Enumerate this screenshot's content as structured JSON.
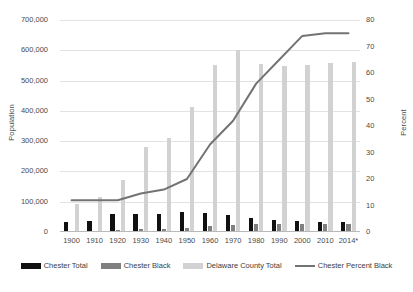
{
  "chart_data": {
    "type": "bar",
    "title": "",
    "subtitle": "",
    "xlabel": "",
    "ylabel": "Population",
    "ylabel_secondary": "Percent",
    "ylim": [
      0,
      700000
    ],
    "ylim_secondary": [
      0,
      80
    ],
    "grid": true,
    "legend_position": "bottom",
    "categories": [
      "1900",
      "1910",
      "1920",
      "1930",
      "1940",
      "1950",
      "1960",
      "1970",
      "1980",
      "1990",
      "2000",
      "2010",
      "2014*"
    ],
    "ytick_labels": [
      "0",
      "100,000",
      "200,000",
      "300,000",
      "400,000",
      "500,000",
      "600,000",
      "700,000"
    ],
    "ytick_values": [
      0,
      100000,
      200000,
      300000,
      400000,
      500000,
      600000,
      700000
    ],
    "ytick_labels_secondary": [
      "0",
      "10",
      "20",
      "30",
      "40",
      "50",
      "60",
      "70",
      "80"
    ],
    "ytick_values_secondary": [
      0,
      10,
      20,
      30,
      40,
      50,
      60,
      70,
      80
    ],
    "series": [
      {
        "name": "Chester Total",
        "kind": "bar",
        "axis": "left",
        "color": "#111111",
        "values": [
          34000,
          38000,
          58000,
          59000,
          59000,
          66000,
          63000,
          56000,
          45000,
          41000,
          36000,
          34000,
          34000
        ]
      },
      {
        "name": "Chester Black",
        "kind": "bar",
        "axis": "left",
        "color": "#808080",
        "values": [
          4000,
          4500,
          7000,
          8500,
          9000,
          13000,
          21000,
          23000,
          26000,
          26000,
          27000,
          25000,
          25000
        ]
      },
      {
        "name": "Delaware County Total",
        "kind": "bar",
        "axis": "left",
        "color": "#d2d2d2",
        "values": [
          94000,
          117000,
          173000,
          280000,
          310000,
          414000,
          553000,
          600000,
          555000,
          547000,
          550000,
          558000,
          560000
        ]
      },
      {
        "name": "Chester Percent Black",
        "kind": "line",
        "axis": "right",
        "color": "#737373",
        "values": [
          12,
          12,
          12,
          14.5,
          16,
          20,
          33,
          42,
          56,
          65,
          74,
          75,
          75
        ]
      }
    ]
  }
}
